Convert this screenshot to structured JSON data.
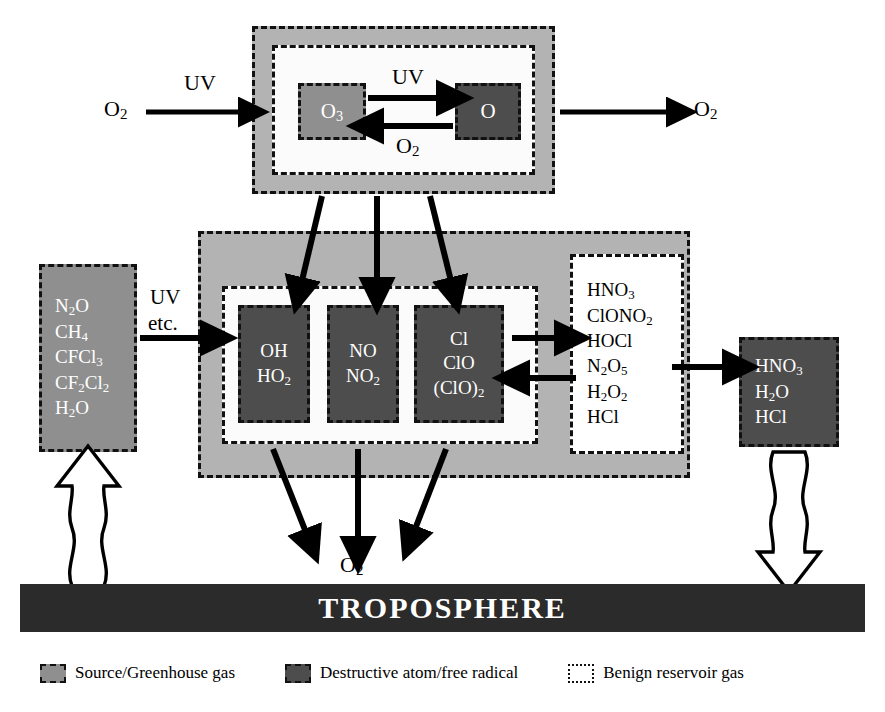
{
  "diagram": {
    "troposphere_label": "TROPOSPHERE",
    "colors": {
      "source_gas": "#8f8f8f",
      "radical": "#4d4d4d",
      "reservoir": "#ffffff",
      "band": "#b3b3b3",
      "troposphere": "#2b2b2b"
    }
  },
  "upper_region": {
    "ozone_box": {
      "species": [
        "O3"
      ]
    },
    "oxygen_box": {
      "species": [
        "O"
      ]
    },
    "forward_label": "UV",
    "reverse_label": "O2",
    "inflow_label": "O2",
    "inflow_driver": "UV",
    "outflow_label": "O2"
  },
  "source_box": {
    "species": [
      "N2O",
      "CH4",
      "CFCl3",
      "CF2Cl2",
      "H2O"
    ],
    "driver_line1": "UV",
    "driver_line2": "etc."
  },
  "radical_boxes": [
    {
      "species": [
        "OH",
        "HO2"
      ]
    },
    {
      "species": [
        "NO",
        "NO2"
      ]
    },
    {
      "species": [
        "Cl",
        "ClO",
        "(ClO)2"
      ]
    }
  ],
  "reservoir_box": {
    "species": [
      "HNO3",
      "ClONO2",
      "HOCl",
      "N2O5",
      "H2O2",
      "HCl"
    ]
  },
  "washout_box": {
    "species": [
      "HNO3",
      "H2O",
      "HCl"
    ]
  },
  "outflow": {
    "label": "O2"
  },
  "legend": {
    "items": [
      {
        "swatch": "src",
        "label": "Source/Greenhouse gas"
      },
      {
        "swatch": "rad",
        "label": "Destructive atom/free radical"
      },
      {
        "swatch": "res",
        "label": "Benign reservoir gas"
      }
    ]
  }
}
